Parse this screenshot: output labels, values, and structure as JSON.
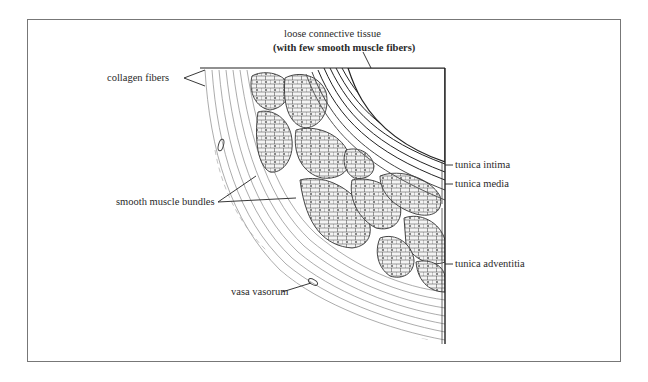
{
  "figure": {
    "labels": {
      "loose_connective_line1": "loose connective tissue",
      "loose_connective_line2": "(with few smooth muscle fibers)",
      "collagen_fibers": "collagen fibers",
      "smooth_muscle_bundles": "smooth muscle bundles",
      "vasa_vasorum": "vasa vasorum",
      "tunica_intima": "tunica intima",
      "tunica_media": "tunica media",
      "tunica_adventitia": "tunica adventitia"
    },
    "colors": {
      "ink": "#222222",
      "frame": "#777777",
      "background": "#ffffff"
    }
  }
}
